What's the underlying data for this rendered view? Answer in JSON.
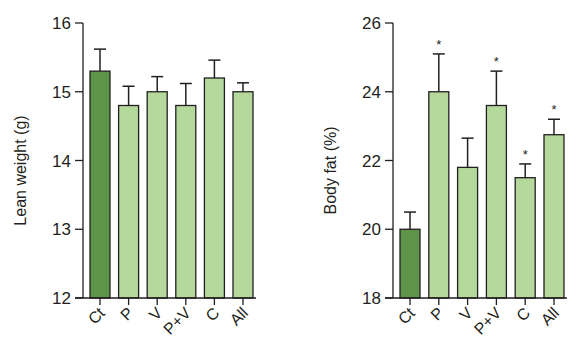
{
  "colors": {
    "control_fill": "#5d9448",
    "treatment_fill": "#b5d99c",
    "stroke": "#231f20"
  },
  "chart_data": [
    {
      "type": "bar",
      "title": "",
      "xlabel": "",
      "ylabel": "Lean weight (g)",
      "ylim": [
        12,
        16
      ],
      "yticks": [
        12,
        13,
        14,
        15,
        16
      ],
      "grid": false,
      "categories": [
        "Ct",
        "P",
        "V",
        "P+V",
        "C",
        "All"
      ],
      "values": [
        15.3,
        14.8,
        15.0,
        14.8,
        15.2,
        15.0
      ],
      "error_upper": [
        15.62,
        15.08,
        15.22,
        15.12,
        15.46,
        15.13
      ],
      "significance": [
        "",
        "",
        "",
        "",
        "",
        ""
      ]
    },
    {
      "type": "bar",
      "title": "",
      "xlabel": "",
      "ylabel": "Body fat (%)",
      "ylim": [
        18,
        26
      ],
      "yticks": [
        18,
        20,
        22,
        24,
        26
      ],
      "grid": false,
      "categories": [
        "Ct",
        "P",
        "V",
        "P+V",
        "C",
        "All"
      ],
      "values": [
        20.0,
        24.0,
        21.8,
        23.6,
        21.5,
        22.75
      ],
      "error_upper": [
        20.5,
        25.1,
        22.65,
        24.6,
        21.9,
        23.2
      ],
      "significance": [
        "",
        "*",
        "",
        "*",
        "*",
        "*"
      ]
    }
  ]
}
